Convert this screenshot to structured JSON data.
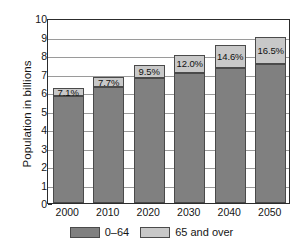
{
  "chart_data": {
    "type": "bar",
    "subtype": "stacked-bar",
    "title": "",
    "xlabel": "",
    "ylabel": "Population in billions",
    "categories": [
      "2000",
      "2010",
      "2020",
      "2030",
      "2040",
      "2050"
    ],
    "ylim": [
      0,
      10
    ],
    "ytick_values": [
      0,
      1,
      2,
      3,
      4,
      5,
      6,
      7,
      8,
      9,
      10
    ],
    "ytick_labels": [
      "0",
      "1",
      "2",
      "3",
      "4",
      "5",
      "6",
      "7",
      "8",
      "9",
      "10"
    ],
    "grid": true,
    "grid_axis": "y",
    "legend_position": "bottom",
    "series": [
      {
        "name": "0–64",
        "color": "#808080",
        "values": [
          5.76,
          6.27,
          6.74,
          7.04,
          7.3,
          7.52
        ]
      },
      {
        "name": "65 and over",
        "color": "#c8c8c8",
        "values": [
          0.44,
          0.53,
          0.71,
          0.96,
          1.25,
          1.48
        ]
      }
    ],
    "totals": [
      6.2,
      6.8,
      7.45,
      8.0,
      8.55,
      9.0
    ],
    "annotations": [
      "7.1%",
      "7.7%",
      "9.5%",
      "12.0%",
      "14.6%",
      "16.5%"
    ]
  },
  "legend": {
    "items": [
      {
        "label": "0–64",
        "color": "#808080"
      },
      {
        "label": "65 and over",
        "color": "#c8c8c8"
      }
    ]
  }
}
